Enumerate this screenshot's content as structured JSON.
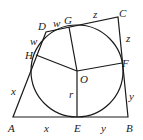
{
  "diagram": {
    "colors": {
      "stroke": "#1a1a1a",
      "background": "#ffffff"
    },
    "points": {
      "A": {
        "label": "A",
        "x": 13,
        "y": 117
      },
      "B": {
        "label": "B",
        "x": 128,
        "y": 117
      },
      "C": {
        "label": "C",
        "x": 118,
        "y": 17
      },
      "D": {
        "label": "D",
        "x": 46,
        "y": 32
      },
      "E": {
        "label": "E",
        "x": 77,
        "y": 117
      },
      "F": {
        "label": "F",
        "x": 122,
        "y": 63
      },
      "G": {
        "label": "G",
        "x": 69,
        "y": 27
      },
      "H": {
        "label": "H",
        "x": 36,
        "y": 55
      },
      "O": {
        "label": "O",
        "x": 77,
        "y": 71
      }
    },
    "circle": {
      "center": "O",
      "radius": 46
    },
    "segment_labels": {
      "AH": "x",
      "AE": "x",
      "EB": "y",
      "BF": "y",
      "FC": "z",
      "CG": "z",
      "GD": "w",
      "DH": "w",
      "OE": "r"
    }
  }
}
